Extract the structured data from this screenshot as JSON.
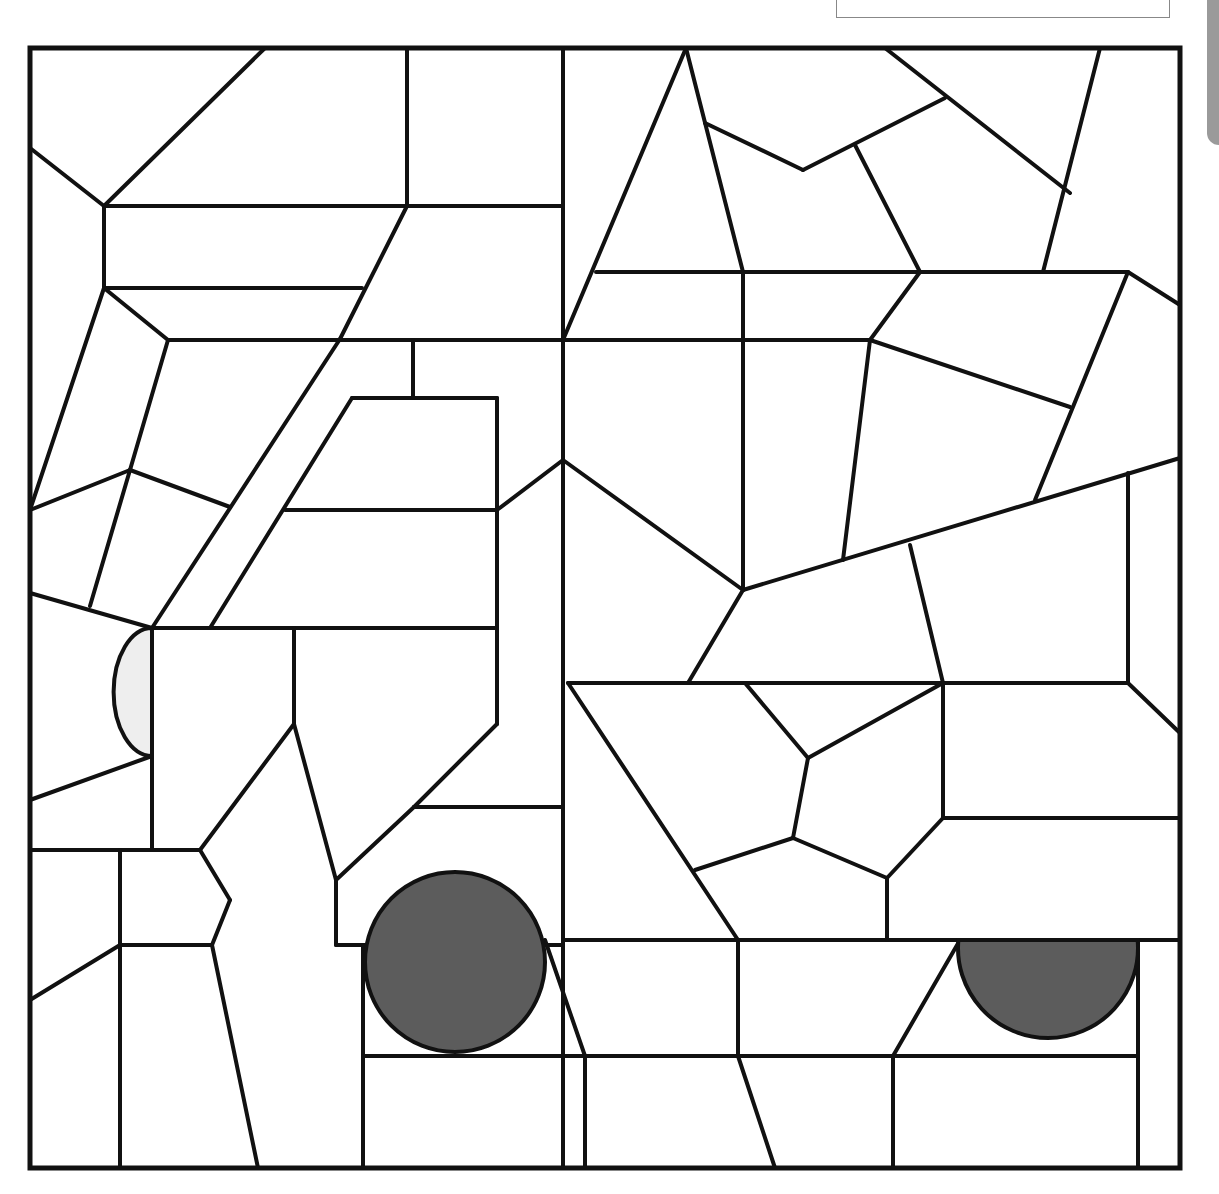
{
  "page": {
    "title": "",
    "name_box_text": "",
    "colors": {
      "line": "#111111",
      "background": "#ffffff",
      "wheel_fill": "#5c5c5c",
      "headlight_fill": "#eeeeee",
      "side_tab": "#9a9a9a"
    }
  },
  "mosaic": {
    "frame": {
      "x": 30,
      "y": 48,
      "w": 1150,
      "h": 1120
    },
    "segments": [
      [
        265,
        48,
        104,
        206
      ],
      [
        30,
        148,
        104,
        206
      ],
      [
        104,
        206,
        104,
        288
      ],
      [
        104,
        206,
        407,
        206
      ],
      [
        407,
        48,
        407,
        206
      ],
      [
        407,
        206,
        563,
        206
      ],
      [
        563,
        48,
        563,
        1168
      ],
      [
        407,
        206,
        340,
        339
      ],
      [
        104,
        288,
        362,
        288
      ],
      [
        104,
        288,
        168,
        340
      ],
      [
        168,
        340,
        563,
        340
      ],
      [
        30,
        510,
        104,
        288
      ],
      [
        168,
        340,
        130,
        470
      ],
      [
        130,
        470,
        90,
        606
      ],
      [
        30,
        510,
        130,
        470
      ],
      [
        130,
        470,
        230,
        507
      ],
      [
        340,
        339,
        152,
        628
      ],
      [
        413,
        340,
        413,
        398
      ],
      [
        352,
        398,
        497,
        398
      ],
      [
        352,
        398,
        210,
        628
      ],
      [
        497,
        398,
        497,
        724
      ],
      [
        285,
        510,
        497,
        510
      ],
      [
        497,
        510,
        563,
        460
      ],
      [
        30,
        593,
        152,
        628
      ],
      [
        152,
        628,
        497,
        628
      ],
      [
        152,
        628,
        152,
        850
      ],
      [
        294,
        628,
        294,
        724
      ],
      [
        30,
        800,
        152,
        756
      ],
      [
        294,
        724,
        200,
        850
      ],
      [
        294,
        724,
        336,
        880
      ],
      [
        497,
        724,
        414,
        807
      ],
      [
        414,
        807,
        563,
        807
      ],
      [
        414,
        807,
        336,
        880
      ],
      [
        30,
        850,
        200,
        850
      ],
      [
        120,
        850,
        120,
        1168
      ],
      [
        200,
        850,
        230,
        900
      ],
      [
        230,
        900,
        212,
        945
      ],
      [
        212,
        945,
        120,
        945
      ],
      [
        212,
        945,
        258,
        1168
      ],
      [
        30,
        1000,
        120,
        945
      ],
      [
        336,
        880,
        336,
        945
      ],
      [
        336,
        945,
        563,
        945
      ],
      [
        563,
        940,
        1180,
        940
      ],
      [
        363,
        945,
        363,
        1168
      ],
      [
        363,
        1056,
        585,
        1056
      ],
      [
        545,
        940,
        585,
        1056
      ],
      [
        585,
        1056,
        585,
        1168
      ],
      [
        738,
        940,
        738,
        1056
      ],
      [
        585,
        1056,
        738,
        1056
      ],
      [
        738,
        1056,
        775,
        1168
      ],
      [
        738,
        1056,
        893,
        1056
      ],
      [
        893,
        1056,
        960,
        940
      ],
      [
        893,
        1056,
        893,
        1168
      ],
      [
        893,
        1056,
        1138,
        1056
      ],
      [
        1138,
        940,
        1138,
        1168
      ],
      [
        686,
        48,
        563,
        340
      ],
      [
        686,
        48,
        743,
        272
      ],
      [
        705,
        123,
        803,
        170
      ],
      [
        803,
        170,
        945,
        98
      ],
      [
        885,
        48,
        1070,
        193
      ],
      [
        855,
        145,
        920,
        272
      ],
      [
        1100,
        48,
        1043,
        272
      ],
      [
        596,
        272,
        1128,
        272
      ],
      [
        743,
        272,
        743,
        590
      ],
      [
        920,
        272,
        870,
        340
      ],
      [
        1128,
        272,
        1180,
        305
      ],
      [
        1128,
        272,
        1035,
        500
      ],
      [
        563,
        340,
        870,
        340
      ],
      [
        870,
        340,
        1070,
        407
      ],
      [
        870,
        340,
        843,
        560
      ],
      [
        563,
        460,
        743,
        590
      ],
      [
        743,
        590,
        1180,
        458
      ],
      [
        1128,
        473,
        1128,
        683
      ],
      [
        743,
        590,
        688,
        683
      ],
      [
        910,
        545,
        943,
        683
      ],
      [
        568,
        683,
        943,
        683
      ],
      [
        943,
        683,
        1128,
        683
      ],
      [
        1128,
        683,
        1180,
        733
      ],
      [
        745,
        683,
        808,
        758
      ],
      [
        808,
        758,
        943,
        683
      ],
      [
        808,
        758,
        793,
        838
      ],
      [
        793,
        838,
        695,
        870
      ],
      [
        568,
        683,
        738,
        940
      ],
      [
        793,
        838,
        887,
        878
      ],
      [
        887,
        878,
        887,
        940
      ],
      [
        887,
        878,
        943,
        818
      ],
      [
        943,
        683,
        943,
        818
      ],
      [
        943,
        818,
        1180,
        818
      ]
    ],
    "headlight": {
      "cx": 152,
      "cy": 692,
      "r": 64,
      "label": "headlight"
    },
    "wheels": [
      {
        "cx": 455,
        "cy": 962,
        "r": 90,
        "label": "front-wheel"
      },
      {
        "cx": 1048,
        "cy": 948,
        "r": 90,
        "clip_top": 940,
        "label": "rear-wheel"
      }
    ]
  }
}
